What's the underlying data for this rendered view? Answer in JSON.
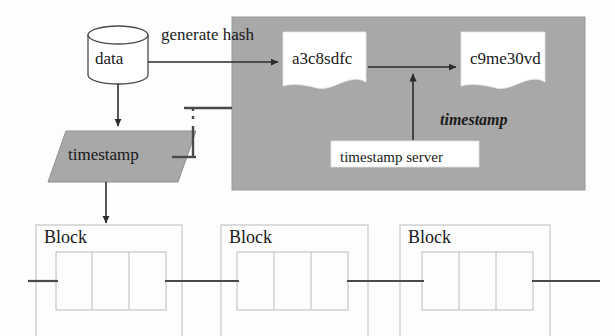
{
  "diagram": {
    "colors": {
      "gray_fill": "#a8a8a8",
      "gray_para": "#a8a8a8",
      "line": "#2b2b2b",
      "block_outline": "#b9b9b9",
      "white": "#ffffff",
      "text": "#1a1a1a"
    },
    "nodes": {
      "data_store": {
        "label": "data",
        "shape": "cylinder"
      },
      "timestamp_process": {
        "label": "timestamp",
        "shape": "parallelogram"
      },
      "hash_one": {
        "label": "a3c8sdfc",
        "shape": "document"
      },
      "hash_two": {
        "label": "c9me30vd",
        "shape": "document"
      },
      "timestamp_server": {
        "label": "timestamp server",
        "shape": "rectangle"
      }
    },
    "edge_labels": {
      "generate_hash": "generate hash",
      "timestamp_italic": "timestamp"
    },
    "blocks": [
      {
        "label": "Block",
        "cells": 3
      },
      {
        "label": "Block",
        "cells": 3
      },
      {
        "label": "Block",
        "cells": 3
      }
    ]
  }
}
